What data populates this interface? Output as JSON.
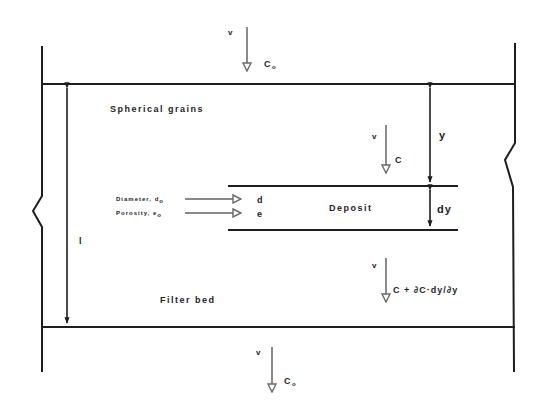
{
  "diagram": {
    "colors": {
      "line": "#1e1e1e",
      "arrow": "#8a8a8a",
      "background": "#ffffff"
    },
    "regions": {
      "upper": "Spherical grains",
      "deposit": "Deposit",
      "lower": "Filter bed"
    },
    "dimensions": {
      "bed_height": "l",
      "depth": "y",
      "layer": "dy"
    },
    "flows": {
      "inlet": {
        "velocity": "v",
        "concentration": "C",
        "concentration_sub": "o"
      },
      "at_depth": {
        "velocity": "v",
        "concentration": "C"
      },
      "below_layer": {
        "velocity": "v",
        "concentration": "C + ∂C·dy/∂y"
      },
      "outlet": {
        "velocity": "v",
        "concentration": "C",
        "concentration_sub": "o"
      }
    },
    "inputs": [
      {
        "label": "Diameter, d",
        "sub": "o",
        "target": "d"
      },
      {
        "label": "Porosity, e",
        "sub": "o",
        "target": "e"
      }
    ]
  }
}
